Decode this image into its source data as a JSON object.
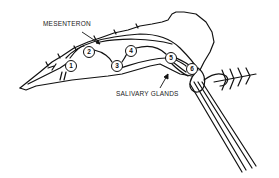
{
  "diagram": {
    "labels": {
      "mesenteron": "MESENTERON",
      "salivary_glands": "SALIVARY GLANDS"
    },
    "markers": [
      {
        "n": "1",
        "x": 65,
        "y": 60
      },
      {
        "n": "2",
        "x": 83,
        "y": 46
      },
      {
        "n": "3",
        "x": 111,
        "y": 60
      },
      {
        "n": "4",
        "x": 125,
        "y": 45
      },
      {
        "n": "5",
        "x": 165,
        "y": 52
      },
      {
        "n": "6",
        "x": 186,
        "y": 63
      }
    ],
    "colors": {
      "line": "#111111",
      "background": "#ffffff"
    }
  }
}
